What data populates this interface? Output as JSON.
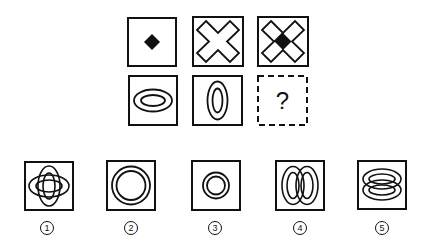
{
  "puzzle": {
    "grid": [
      [
        {
          "id": "r1c1",
          "figure": "small-filled-diamond"
        },
        {
          "id": "r1c2",
          "figure": "hollow-x-cross"
        },
        {
          "id": "r1c3",
          "figure": "hollow-x-cross-with-filled-diamond-center"
        }
      ],
      [
        {
          "id": "r2c1",
          "figure": "horizontal-double-ellipse"
        },
        {
          "id": "r2c2",
          "figure": "vertical-double-ellipse"
        },
        {
          "id": "r2c3",
          "figure": "unknown",
          "text": "?"
        }
      ]
    ],
    "question_mark": "?",
    "options": [
      {
        "label": "1",
        "figure": "crossed-double-ellipses"
      },
      {
        "label": "2",
        "figure": "large-double-circle"
      },
      {
        "label": "3",
        "figure": "small-double-circle"
      },
      {
        "label": "4",
        "figure": "two-side-by-side-vertical-double-ellipses"
      },
      {
        "label": "5",
        "figure": "two-stacked-horizontal-double-ellipses"
      }
    ]
  },
  "colors": {
    "stroke": "#111111",
    "background": "#ffffff"
  }
}
